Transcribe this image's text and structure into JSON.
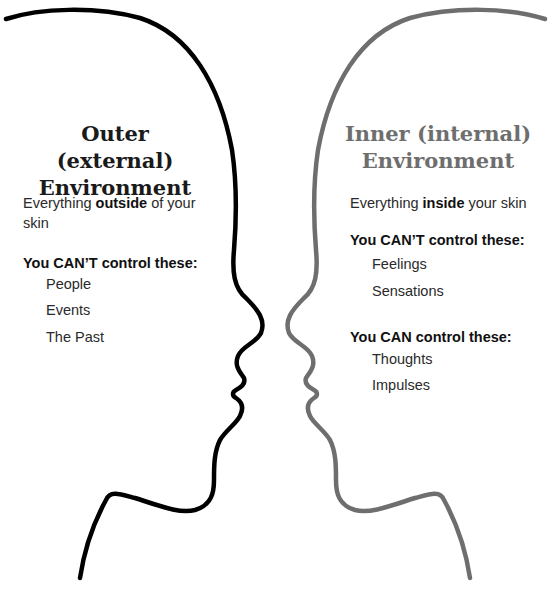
{
  "colors": {
    "outer_profile": "#000000",
    "inner_profile": "#6e6e6e",
    "outer_title": "#1a1a1a",
    "inner_title": "#6e6e6e"
  },
  "outer": {
    "title_line1": "Outer (external)",
    "title_line2": "Environment",
    "desc_pre": "Everything ",
    "desc_bold": "outside",
    "desc_post": " of your skin",
    "cant_heading": "You CAN’T control these:",
    "cant_items": [
      "People",
      "Events",
      "The Past"
    ]
  },
  "inner": {
    "title_line1": "Inner (internal)",
    "title_line2": "Environment",
    "desc_pre": "Everything ",
    "desc_bold": "inside",
    "desc_post": " your skin",
    "cant_heading": "You CAN’T control these:",
    "cant_items": [
      "Feelings",
      "Sensations"
    ],
    "can_heading": "You CAN control these:",
    "can_items": [
      "Thoughts",
      "Impulses"
    ]
  },
  "icons": {
    "outer_profile": "head-silhouette-facing-right",
    "inner_profile": "head-silhouette-facing-left"
  }
}
